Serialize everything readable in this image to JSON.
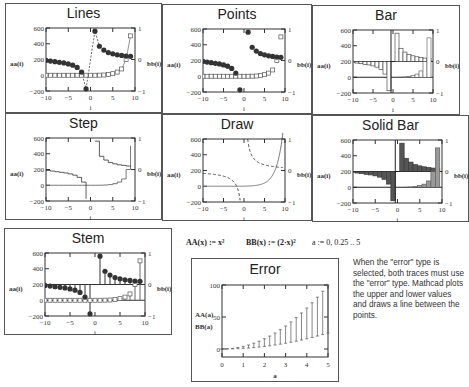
{
  "panels": {
    "lines": {
      "title": "Lines",
      "type": "line",
      "legend_left": "aa(i)",
      "legend_right": "bb(i)"
    },
    "points": {
      "title": "Points",
      "type": "points",
      "legend_left": "aa(i)",
      "legend_right": "bb(i)"
    },
    "bar": {
      "title": "Bar",
      "type": "bar",
      "legend_left": "aa(i)",
      "legend_right": "bb(i)"
    },
    "step": {
      "title": "Step",
      "type": "step",
      "legend_left": "aa(i)",
      "legend_right": "bb(i)"
    },
    "draw": {
      "title": "Draw",
      "type": "draw",
      "legend_left": "aa(i)",
      "legend_right": "bb(i)"
    },
    "solidbar": {
      "title": "Solid Bar",
      "type": "solidbar",
      "legend_left": "aa(i)",
      "legend_right": "bb(i)"
    },
    "stem": {
      "title": "Stem",
      "type": "stem",
      "legend_left": "aa(i)",
      "legend_right": "bb(i)"
    },
    "error": {
      "title": "Error",
      "type": "error",
      "legend_left": "AA(a)",
      "legend_left2": "BB(a)",
      "xlabel": "a"
    }
  },
  "axes": {
    "xlabel": "i",
    "x_ticks": [
      "−10",
      "−5",
      "0",
      "5",
      "10"
    ],
    "y_left_ticks": [
      "600",
      "400",
      "200",
      "0",
      "−200"
    ],
    "y_right_ticks": [
      "1",
      "0",
      "−1"
    ],
    "error_x_ticks": [
      "0",
      "1",
      "2",
      "3",
      "4",
      "5"
    ],
    "error_y_ticks": [
      "100",
      "50",
      "0"
    ]
  },
  "formulas": {
    "aa_def": "AA(x) := x²",
    "bb_def": "BB(x) := (2·x)²",
    "range_def": "a := 0, 0.25 .. 5"
  },
  "note": "When the \"error\" type is selected, both traces must use the \"error\" type. Mathcad plots the upper and lower values and draws a line between the points.",
  "chart_data": [
    {
      "type": "line",
      "title": "Lines",
      "xlabel": "i",
      "ylabel_left": "aa(i)",
      "ylabel_right": "bb(i)",
      "xlim": [
        -10,
        10
      ],
      "ylim_left": [
        -200,
        600
      ],
      "ylim_right": [
        -1,
        1
      ],
      "x": [
        -10,
        -9,
        -8,
        -7,
        -6,
        -5,
        -4,
        -3,
        -2,
        -1,
        0,
        1,
        2,
        3,
        4,
        5,
        6,
        7,
        8,
        9
      ],
      "series": [
        {
          "name": "aa(i)",
          "axis": "left",
          "values": [
            0,
            0,
            0,
            0,
            0,
            0,
            0,
            0,
            0,
            0,
            0,
            0,
            1,
            3,
            8,
            20,
            40,
            80,
            200,
            500
          ]
        },
        {
          "name": "bb(i)",
          "axis": "right",
          "values": [
            -0.03,
            -0.05,
            -0.07,
            -0.09,
            -0.11,
            -0.14,
            -0.18,
            -0.25,
            -0.4,
            -0.93,
            null,
            0.9,
            0.42,
            0.3,
            0.22,
            0.18,
            0.15,
            0.13,
            0.11,
            0.1
          ]
        }
      ]
    },
    {
      "type": "scatter",
      "title": "Points",
      "same_data_as": "Lines"
    },
    {
      "type": "bar",
      "title": "Bar",
      "same_data_as": "Lines"
    },
    {
      "type": "step",
      "title": "Step",
      "same_data_as": "Lines"
    },
    {
      "type": "line",
      "title": "Draw",
      "same_data_as": "Lines"
    },
    {
      "type": "bar",
      "title": "Solid Bar",
      "same_data_as": "Lines"
    },
    {
      "type": "stem",
      "title": "Stem",
      "same_data_as": "Lines"
    },
    {
      "type": "error",
      "title": "Error",
      "xlabel": "a",
      "ylabel": "AA(a), BB(a)",
      "xlim": [
        0,
        5
      ],
      "ylim": [
        0,
        100
      ],
      "x": [
        0,
        0.25,
        0.5,
        0.75,
        1,
        1.25,
        1.5,
        1.75,
        2,
        2.25,
        2.5,
        2.75,
        3,
        3.25,
        3.5,
        3.75,
        4,
        4.25,
        4.5,
        4.75,
        5
      ],
      "series": [
        {
          "name": "AA(a)",
          "values": [
            0,
            0.0625,
            0.25,
            0.5625,
            1,
            1.5625,
            2.25,
            3.0625,
            4,
            5.0625,
            6.25,
            7.5625,
            9,
            10.5625,
            12.25,
            14.0625,
            16,
            18.0625,
            20.25,
            22.5625,
            25
          ]
        },
        {
          "name": "BB(a)",
          "values": [
            0,
            0.25,
            1,
            2.25,
            4,
            6.25,
            9,
            12.25,
            16,
            20.25,
            25,
            30.25,
            36,
            42.25,
            49,
            56.25,
            64,
            72.25,
            81,
            90.25,
            100
          ]
        }
      ]
    }
  ]
}
